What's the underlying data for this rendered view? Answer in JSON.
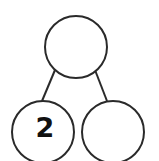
{
  "diagram": {
    "type": "number-bond",
    "whole": {
      "value": ""
    },
    "parts": [
      {
        "value": "2"
      },
      {
        "value": ""
      }
    ]
  },
  "colors": {
    "stroke": "#2a2a2a",
    "text": "#111111",
    "background": "#ffffff"
  }
}
